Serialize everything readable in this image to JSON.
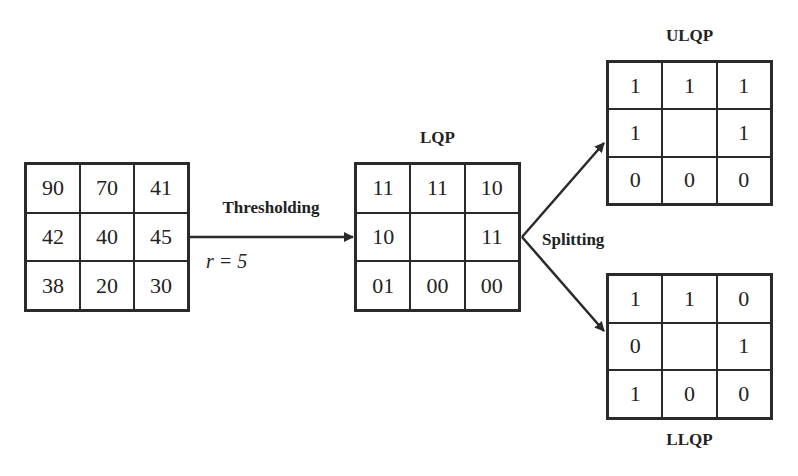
{
  "input_patch": {
    "cells": [
      "90",
      "70",
      "41",
      "42",
      "40",
      "45",
      "38",
      "20",
      "30"
    ]
  },
  "thresholding": {
    "label": "Thresholding",
    "param": "r = 5"
  },
  "lqp": {
    "title": "LQP",
    "cells": [
      "11",
      "11",
      "10",
      "10",
      "",
      "11",
      "01",
      "00",
      "00"
    ]
  },
  "splitting": {
    "label": "Splitting"
  },
  "ulqp": {
    "title": "ULQP",
    "cells": [
      "1",
      "1",
      "1",
      "1",
      "",
      "1",
      "0",
      "0",
      "0"
    ]
  },
  "llqp": {
    "title": "LLQP",
    "cells": [
      "1",
      "1",
      "0",
      "0",
      "",
      "1",
      "1",
      "0",
      "0"
    ]
  }
}
